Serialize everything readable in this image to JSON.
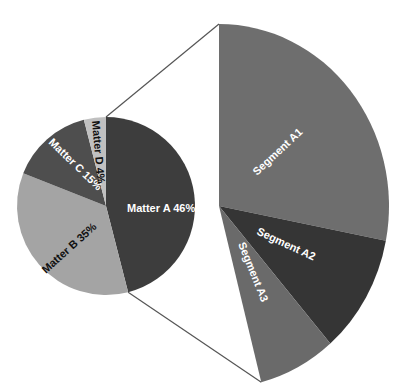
{
  "chart_data": {
    "type": "pie",
    "subtype": "pie-of-pie",
    "title": "",
    "main_pie": {
      "slices": [
        {
          "label": "Matter A 46%",
          "name": "Matter A",
          "value": 46,
          "color": "#3d3d3d",
          "text_color": "#ffffff"
        },
        {
          "label": "Matter B 35%",
          "name": "Matter B",
          "value": 35,
          "color": "#a4a4a4",
          "text_color": "#111111"
        },
        {
          "label": "Matter C 15%",
          "name": "Matter C",
          "value": 15,
          "color": "#4e4e4e",
          "text_color": "#ffffff"
        },
        {
          "label": "Matter D 4%",
          "name": "Matter D",
          "value": 4,
          "color": "#c0c0c0",
          "text_color": "#111111"
        }
      ],
      "start_angle_deg": -90,
      "direction": "clockwise"
    },
    "exploded_slice": "Matter A",
    "secondary_sector": {
      "segments": [
        {
          "label": "Segment A1",
          "name": "Segment A1",
          "share_of_parent_est": 61,
          "color": "#6e6e6e",
          "text_color": "#ffffff"
        },
        {
          "label": "Segment A2",
          "name": "Segment A2",
          "share_of_parent_est": 23,
          "color": "#353535",
          "text_color": "#ffffff"
        },
        {
          "label": "Segment A3",
          "name": "Segment A3",
          "share_of_parent_est": 16,
          "color": "#6a6a6a",
          "text_color": "#ffffff"
        }
      ]
    },
    "connector_color": "#555555",
    "legend": "none",
    "grid": false
  },
  "labels": {
    "matter_a": "Matter A 46%",
    "matter_b": "Matter B 35%",
    "matter_c": "Matter C 15%",
    "matter_d": "Matter D 4%",
    "segment_a1": "Segment A1",
    "segment_a2": "Segment A2",
    "segment_a3": "Segment A3"
  }
}
